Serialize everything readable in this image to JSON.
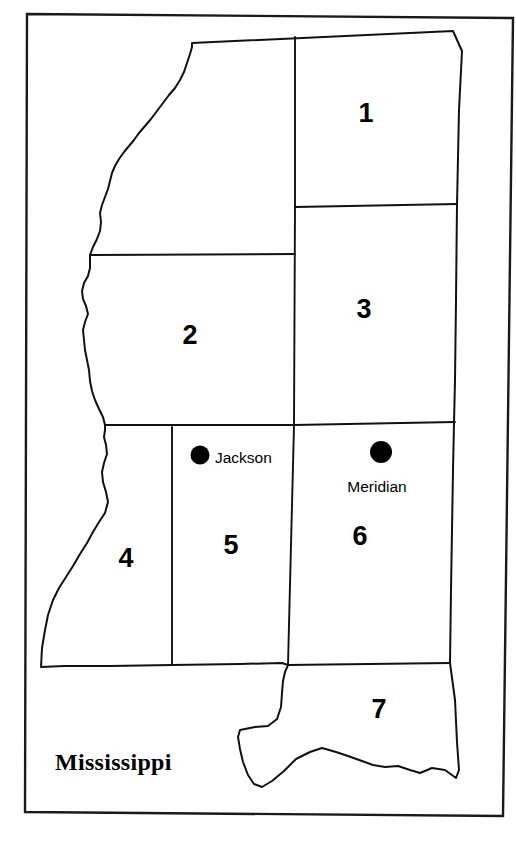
{
  "map": {
    "title": "Mississippi",
    "state_label": "Mississippi",
    "frame": {
      "stroke_color": "#1a1a1a",
      "background_color": "#ffffff"
    },
    "outline_color": "#111111",
    "regions": [
      {
        "id": "region-1",
        "label": "1",
        "cx": 366,
        "cy": 115
      },
      {
        "id": "region-2",
        "label": "2",
        "cx": 190,
        "cy": 337
      },
      {
        "id": "region-3",
        "label": "3",
        "cx": 364,
        "cy": 311
      },
      {
        "id": "region-4",
        "label": "4",
        "cx": 126,
        "cy": 560
      },
      {
        "id": "region-5",
        "label": "5",
        "cx": 231,
        "cy": 547
      },
      {
        "id": "region-6",
        "label": "6",
        "cx": 360,
        "cy": 538
      },
      {
        "id": "region-7",
        "label": "7",
        "cx": 379,
        "cy": 711
      }
    ],
    "cities": [
      {
        "id": "city-jackson",
        "name": "Jackson",
        "dot_x": 200,
        "dot_y": 455,
        "dot_r": 9.5,
        "label_x": 215,
        "label_y": 459,
        "label_anchor": "start"
      },
      {
        "id": "city-meridian",
        "name": "Meridian",
        "dot_x": 381,
        "dot_y": 452,
        "dot_r": 11.0,
        "label_x": 377,
        "label_y": 488,
        "label_anchor": "middle"
      }
    ],
    "state_name_position": {
      "x": 55,
      "y": 764
    }
  }
}
